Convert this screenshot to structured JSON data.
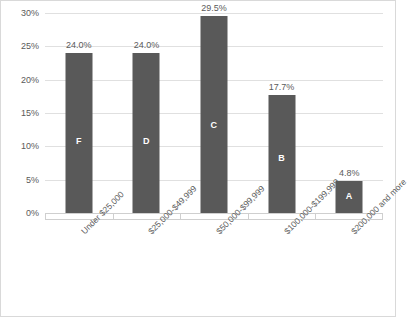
{
  "chart_data": {
    "type": "bar",
    "title": "",
    "xlabel": "",
    "ylabel": "",
    "ylim": [
      0,
      30
    ],
    "grid": true,
    "legend": "none",
    "categories": [
      "Under $25,000",
      "$25,000-$49,999",
      "$50,000-$99,999",
      "$100,000-$199,999",
      "$200,000 and more"
    ],
    "values": [
      24.0,
      24.0,
      29.5,
      17.7,
      4.8
    ],
    "value_labels": [
      "24.0%",
      "24.0%",
      "29.5%",
      "17.7%",
      "4.8%"
    ],
    "bar_letters": [
      "F",
      "D",
      "C",
      "B",
      "A"
    ],
    "yticks": [
      30,
      25,
      20,
      15,
      10,
      5,
      0
    ],
    "ytick_labels": [
      "30%",
      "25%",
      "20%",
      "15%",
      "10%",
      "5%",
      "0%"
    ],
    "colors": {
      "bar": "#595959",
      "bar_letter": "#ffffff",
      "gridline": "#e0e0e0",
      "axis": "#cfcfcf",
      "tick_text": "#5a5a5a",
      "frame": "#d9d9d9",
      "background": "#ffffff"
    }
  }
}
